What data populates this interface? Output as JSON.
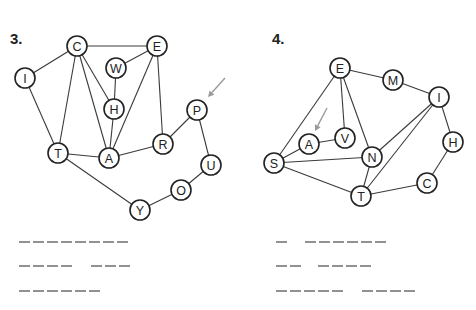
{
  "puzzles": [
    {
      "number": "3.",
      "number_pos": [
        10,
        44
      ],
      "nodes": [
        {
          "id": "C",
          "label": "C",
          "x": 77,
          "y": 46
        },
        {
          "id": "E",
          "label": "E",
          "x": 157,
          "y": 46
        },
        {
          "id": "W",
          "label": "W",
          "x": 116,
          "y": 68
        },
        {
          "id": "I",
          "label": "I",
          "x": 25,
          "y": 78
        },
        {
          "id": "H",
          "label": "H",
          "x": 114,
          "y": 109
        },
        {
          "id": "P",
          "label": "P",
          "x": 197,
          "y": 110
        },
        {
          "id": "R",
          "label": "R",
          "x": 163,
          "y": 144
        },
        {
          "id": "T",
          "label": "T",
          "x": 58,
          "y": 153
        },
        {
          "id": "A",
          "label": "A",
          "x": 109,
          "y": 158
        },
        {
          "id": "U",
          "label": "U",
          "x": 211,
          "y": 165
        },
        {
          "id": "O",
          "label": "O",
          "x": 181,
          "y": 190
        },
        {
          "id": "Y",
          "label": "Y",
          "x": 140,
          "y": 210
        }
      ],
      "edges": [
        [
          "C",
          "E"
        ],
        [
          "C",
          "I"
        ],
        [
          "C",
          "T"
        ],
        [
          "C",
          "H"
        ],
        [
          "C",
          "A"
        ],
        [
          "E",
          "W"
        ],
        [
          "E",
          "A"
        ],
        [
          "E",
          "R"
        ],
        [
          "W",
          "H"
        ],
        [
          "H",
          "A"
        ],
        [
          "I",
          "T"
        ],
        [
          "T",
          "A"
        ],
        [
          "T",
          "Y"
        ],
        [
          "A",
          "R"
        ],
        [
          "R",
          "P"
        ],
        [
          "P",
          "U"
        ],
        [
          "U",
          "O"
        ],
        [
          "O",
          "Y"
        ]
      ],
      "start_arrow": {
        "target": "P",
        "from": [
          225,
          78
        ],
        "to": [
          208,
          97
        ]
      },
      "answer_lines": [
        {
          "y": 242,
          "groups": [
            {
              "x": 19,
              "count": 8
            }
          ]
        },
        {
          "y": 266,
          "groups": [
            {
              "x": 19,
              "count": 4
            },
            {
              "x": 91,
              "count": 3
            }
          ]
        },
        {
          "y": 291,
          "groups": [
            {
              "x": 19,
              "count": 6
            }
          ]
        }
      ]
    },
    {
      "number": "4.",
      "number_pos": [
        272,
        44
      ],
      "nodes": [
        {
          "id": "E",
          "label": "E",
          "x": 340,
          "y": 68
        },
        {
          "id": "M",
          "label": "M",
          "x": 393,
          "y": 80
        },
        {
          "id": "I",
          "label": "I",
          "x": 439,
          "y": 97
        },
        {
          "id": "V",
          "label": "V",
          "x": 345,
          "y": 138
        },
        {
          "id": "A",
          "label": "A",
          "x": 309,
          "y": 144
        },
        {
          "id": "H",
          "label": "H",
          "x": 453,
          "y": 142
        },
        {
          "id": "N",
          "label": "N",
          "x": 372,
          "y": 157
        },
        {
          "id": "S",
          "label": "S",
          "x": 274,
          "y": 163
        },
        {
          "id": "C",
          "label": "C",
          "x": 427,
          "y": 183
        },
        {
          "id": "T",
          "label": "T",
          "x": 361,
          "y": 196
        }
      ],
      "edges": [
        [
          "E",
          "M"
        ],
        [
          "M",
          "I"
        ],
        [
          "E",
          "S"
        ],
        [
          "E",
          "V"
        ],
        [
          "E",
          "N"
        ],
        [
          "V",
          "A"
        ],
        [
          "A",
          "S"
        ],
        [
          "S",
          "N"
        ],
        [
          "S",
          "T"
        ],
        [
          "N",
          "I"
        ],
        [
          "N",
          "T"
        ],
        [
          "T",
          "I"
        ],
        [
          "I",
          "H"
        ],
        [
          "H",
          "C"
        ],
        [
          "C",
          "T"
        ]
      ],
      "start_arrow": {
        "target": "A",
        "from": [
          327,
          108
        ],
        "to": [
          315,
          131
        ]
      },
      "answer_lines": [
        {
          "y": 242,
          "groups": [
            {
              "x": 276,
              "count": 1
            },
            {
              "x": 305,
              "count": 6
            }
          ]
        },
        {
          "y": 266,
          "groups": [
            {
              "x": 276,
              "count": 2
            },
            {
              "x": 318,
              "count": 4
            }
          ]
        },
        {
          "y": 291,
          "groups": [
            {
              "x": 276,
              "count": 5
            },
            {
              "x": 362,
              "count": 4
            }
          ]
        }
      ]
    }
  ],
  "style": {
    "node_radius": 10,
    "dash_width": 11,
    "dash_gap": 3,
    "line_color": "#3a3a3a",
    "node_stroke": "#222222",
    "arrow_color": "#9a9a9a",
    "dash_color": "#555555"
  }
}
